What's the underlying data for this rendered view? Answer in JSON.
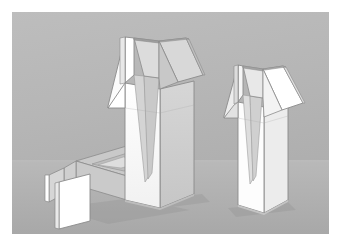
{
  "scene": {
    "kind": "3d-cad-render",
    "title": "",
    "background_color": "#b4b4b4",
    "page_color": "#ffffff",
    "ground_color": "#b0b0b0",
    "horizon_color": "#bdbdbd",
    "edge_color": "#6e6e6e",
    "edge_color_soft": "#8d8d8d",
    "canvas": {
      "x": 12,
      "y": 12,
      "width": 317,
      "height": 222
    },
    "objects": [
      {
        "id": "carton-lying",
        "name": "lying-carton",
        "label": "Lying carton with opened V-tear strip",
        "state": "lying-down",
        "faces": {
          "top": "#c4c4c4",
          "front": "#bdbdbd",
          "side": "#d2d2d2",
          "flap": "#ffffff",
          "inner": "#cfcfcf"
        }
      },
      {
        "id": "carton-center",
        "name": "center-carton",
        "label": "Standing carton with two flaps open and V-shaped tear",
        "state": "standing-open",
        "faces": {
          "front": "#fbfbfb",
          "side": "#cfcfcf",
          "flap_left": "#ffffff",
          "flap_right": "#d8d8d8",
          "tear_v": "#d6d6d6",
          "top": "#e6e6e6"
        }
      },
      {
        "id": "carton-right",
        "name": "right-carton",
        "label": "Standing carton with folded-back flap and V-shaped tear",
        "state": "standing-open",
        "faces": {
          "front": "#fcfcfc",
          "side": "#e2e2e2",
          "flap_back": "#ededed",
          "flap_front": "#ffffff",
          "tear_v": "#dcdcdc",
          "top": "#f2f2f2"
        }
      }
    ],
    "shadows": {
      "color": "#a3a3a3",
      "opacity": 0.55
    }
  },
  "chart_data": {
    "type": "table",
    "categories": [
      "lying carton",
      "center standing carton",
      "right standing carton"
    ],
    "values": [
      1,
      1,
      1
    ],
    "xlabel": "",
    "ylabel": ""
  }
}
